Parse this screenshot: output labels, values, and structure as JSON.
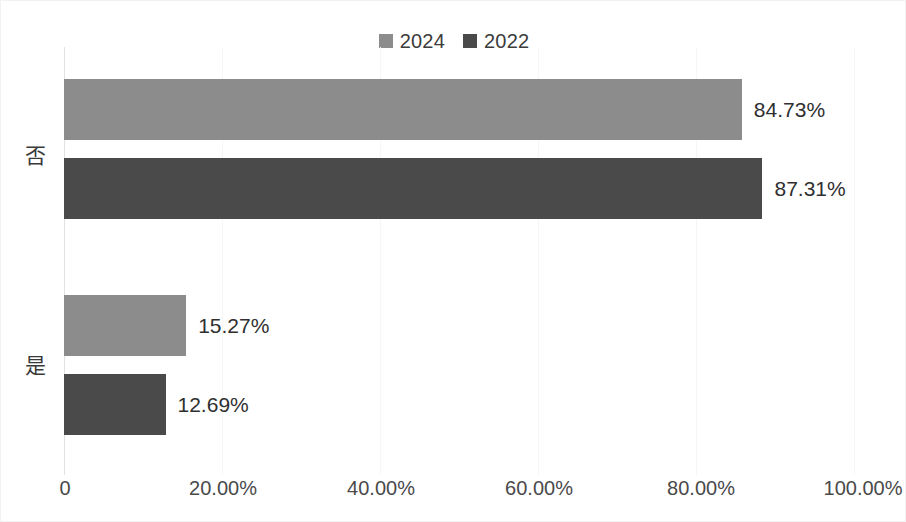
{
  "chart_data": {
    "type": "bar",
    "orientation": "horizontal",
    "title": "",
    "xlabel": "",
    "ylabel": "",
    "categories": [
      "否",
      "是"
    ],
    "series": [
      {
        "name": "2024",
        "color": "#8c8c8c",
        "values": [
          84.73,
          15.27
        ],
        "labels": [
          "84.73%",
          "15.27%"
        ]
      },
      {
        "name": "2022",
        "color": "#4a4a4a",
        "values": [
          87.31,
          12.69
        ],
        "labels": [
          "87.31%",
          "12.69%"
        ]
      }
    ],
    "xlim": [
      0,
      100
    ],
    "xticks": [
      0,
      20,
      40,
      60,
      80,
      100
    ],
    "xtick_labels": [
      "0",
      "20.00%",
      "40.00%",
      "60.00%",
      "80.00%",
      "100.00%"
    ],
    "grid": true,
    "legend_position": "top-center"
  },
  "legend": {
    "entries": [
      {
        "label": "2024",
        "color": "#8c8c8c"
      },
      {
        "label": "2022",
        "color": "#4a4a4a"
      }
    ]
  },
  "axis": {
    "category_labels": [
      "否",
      "是"
    ],
    "tick_labels": [
      "0",
      "20.00%",
      "40.00%",
      "60.00%",
      "80.00%",
      "100.00%"
    ]
  },
  "bars": [
    {
      "category": "否",
      "series": "2024",
      "value": 84.73,
      "label": "84.73%",
      "color": "#8c8c8c"
    },
    {
      "category": "否",
      "series": "2022",
      "value": 87.31,
      "label": "87.31%",
      "color": "#4a4a4a"
    },
    {
      "category": "是",
      "series": "2024",
      "value": 15.27,
      "label": "15.27%",
      "color": "#8c8c8c"
    },
    {
      "category": "是",
      "series": "2022",
      "value": 12.69,
      "label": "12.69%",
      "color": "#4a4a4a"
    }
  ]
}
